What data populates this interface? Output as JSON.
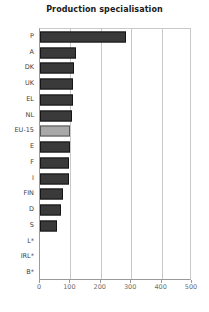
{
  "chart_data": {
    "type": "bar",
    "orientation": "horizontal",
    "title": "Production specialisation",
    "xlabel": "",
    "ylabel": "",
    "xlim": [
      0,
      500
    ],
    "xticks": [
      0,
      100,
      200,
      300,
      400,
      500
    ],
    "xtick_labels": [
      "0",
      "100",
      "200",
      "300",
      "400",
      "500"
    ],
    "grid": true,
    "grid_axis": "x",
    "legend": null,
    "categories": [
      "P",
      "A",
      "DK",
      "UK",
      "EL",
      "NL",
      "EU-15",
      "E",
      "F",
      "I",
      "FIN",
      "D",
      "S",
      "L*",
      "IRL*",
      "B*"
    ],
    "values": [
      282,
      118,
      112,
      110,
      108,
      105,
      100,
      98,
      97,
      95,
      75,
      68,
      55,
      0,
      0,
      0
    ],
    "highlight_category": "EU-15",
    "colors": {
      "bar": "#3a3a3a",
      "bar_edge": "#151515",
      "highlight_bar": "#a8a8a8",
      "highlight_edge": "#555555",
      "grid": "#c9c9c9",
      "axis": "#9a9a9a",
      "title_text": "#1a1a1a",
      "tick_text": "#6e6e6e",
      "category_text": "#3d3d3d",
      "background": "#ffffff"
    }
  }
}
